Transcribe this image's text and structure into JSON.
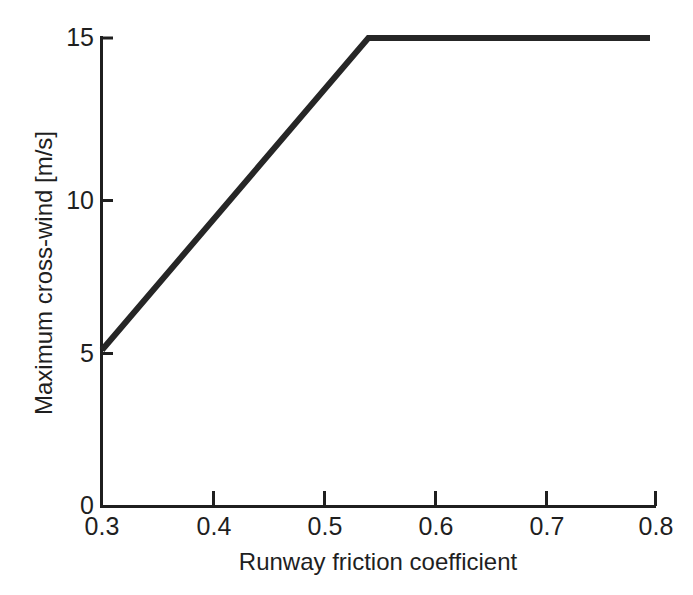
{
  "chart_data": {
    "type": "line",
    "title": "",
    "subtitle": "",
    "xlabel": "Runway friction coefficient",
    "ylabel": "Maximum cross-wind [m/s]",
    "xlim": [
      0.3,
      0.8
    ],
    "ylim": [
      0,
      15
    ],
    "grid": false,
    "legend": null,
    "x_ticks": [
      0.3,
      0.4,
      0.5,
      0.6,
      0.7,
      0.8
    ],
    "x_tick_labels": [
      "0.3",
      "0.4",
      "0.5",
      "0.6",
      "0.7",
      "0.8"
    ],
    "y_ticks": [
      0,
      5,
      10,
      15
    ],
    "y_tick_labels": [
      "0",
      "5",
      "10",
      "15"
    ],
    "series": [
      {
        "name": "Maximum cross-wind limit",
        "color": "#262626",
        "line_width": 6,
        "x": [
          0.3,
          0.543,
          0.8
        ],
        "y": [
          5,
          15,
          15
        ],
        "points": [
          {
            "x": 0.3,
            "y": 5
          },
          {
            "x": 0.543,
            "y": 15
          },
          {
            "x": 0.8,
            "y": 15
          }
        ]
      }
    ],
    "annotations": []
  },
  "axes": {
    "x_title": "Runway friction coefficient",
    "y_title": "Maximum cross-wind [m/s]",
    "tick_color": "#1f1f1f",
    "axis_color": "#1f1f1f",
    "background_color": "#ffffff"
  },
  "ticks": {
    "y": [
      {
        "label": "15",
        "value": 15
      },
      {
        "label": "10",
        "value": 10
      },
      {
        "label": "5",
        "value": 5
      },
      {
        "label": "0",
        "value": 0
      }
    ],
    "x": [
      {
        "label": "0.3",
        "value": 0.3
      },
      {
        "label": "0.4",
        "value": 0.4
      },
      {
        "label": "0.5",
        "value": 0.5
      },
      {
        "label": "0.6",
        "value": 0.6
      },
      {
        "label": "0.7",
        "value": 0.7
      },
      {
        "label": "0.8",
        "value": 0.8
      }
    ]
  }
}
